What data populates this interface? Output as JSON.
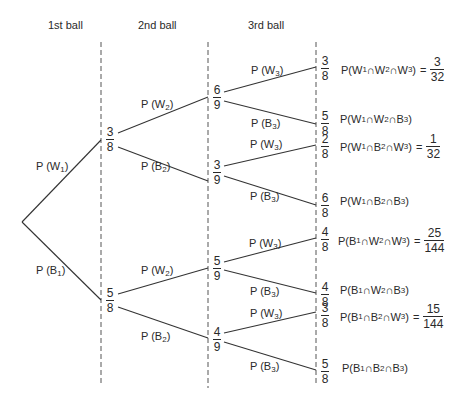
{
  "headers": [
    "1st ball",
    "2nd ball",
    "3rd ball"
  ],
  "edge_labels": {
    "W1": {
      "p": "P (W",
      "sub": "1",
      "close": ")"
    },
    "B1": {
      "p": "P (B",
      "sub": "1",
      "close": ")"
    },
    "W2": {
      "p": "P (W",
      "sub": "2",
      "close": ")"
    },
    "B2": {
      "p": "P (B",
      "sub": "2",
      "close": ")"
    },
    "W3": {
      "p": "P (W",
      "sub": "3",
      "close": ")"
    },
    "B3": {
      "p": "P (B",
      "sub": "3",
      "close": ")"
    }
  },
  "nodes": {
    "level1": [
      {
        "num": "3",
        "den": "8"
      },
      {
        "num": "5",
        "den": "8"
      }
    ],
    "level2": [
      {
        "num": "6",
        "den": "9"
      },
      {
        "num": "3",
        "den": "9"
      },
      {
        "num": "5",
        "den": "9"
      },
      {
        "num": "4",
        "den": "9"
      }
    ],
    "level3": [
      {
        "num": "3",
        "den": "8"
      },
      {
        "num": "5",
        "den": "8"
      },
      {
        "num": "2",
        "den": "8"
      },
      {
        "num": "6",
        "den": "8"
      },
      {
        "num": "4",
        "den": "8"
      },
      {
        "num": "4",
        "den": "8"
      },
      {
        "num": "3",
        "den": "8"
      },
      {
        "num": "5",
        "den": "8"
      }
    ]
  },
  "outcomes": [
    {
      "a": "W",
      "b": "W",
      "c": "W",
      "result": {
        "num": "3",
        "den": "32"
      }
    },
    {
      "a": "W",
      "b": "W",
      "c": "B",
      "result": null
    },
    {
      "a": "W",
      "b": "B",
      "c": "W",
      "result": {
        "num": "1",
        "den": "32"
      }
    },
    {
      "a": "W",
      "b": "B",
      "c": "B",
      "result": null
    },
    {
      "a": "B",
      "b": "W",
      "c": "W",
      "result": {
        "num": "25",
        "den": "144"
      }
    },
    {
      "a": "B",
      "b": "W",
      "c": "B",
      "result": null
    },
    {
      "a": "B",
      "b": "B",
      "c": "W",
      "result": {
        "num": "15",
        "den": "144"
      }
    },
    {
      "a": "B",
      "b": "B",
      "c": "B",
      "result": null
    }
  ],
  "symbols": {
    "intersect": "∩",
    "equals": "=",
    "prefix": "P(",
    "close": ")",
    "sub1": "1",
    "sub2": "2",
    "sub3": "3"
  }
}
